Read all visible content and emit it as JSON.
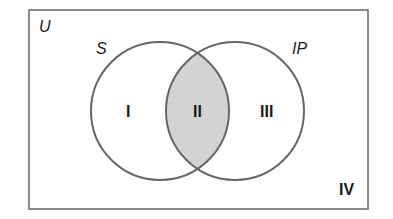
{
  "diagram": {
    "type": "venn",
    "universe_label": "U",
    "sets": [
      {
        "name": "S",
        "label": "S"
      },
      {
        "name": "IP",
        "label": "IP"
      }
    ],
    "regions": [
      {
        "id": "I",
        "label": "I",
        "description": "S only",
        "shaded": false
      },
      {
        "id": "II",
        "label": "II",
        "description": "S and IP",
        "shaded": true
      },
      {
        "id": "III",
        "label": "III",
        "description": "IP only",
        "shaded": false
      },
      {
        "id": "IV",
        "label": "IV",
        "description": "neither",
        "shaded": false
      }
    ],
    "colors": {
      "stroke": "#666666",
      "shade": "#d3d3d3",
      "background": "#ffffff"
    }
  }
}
